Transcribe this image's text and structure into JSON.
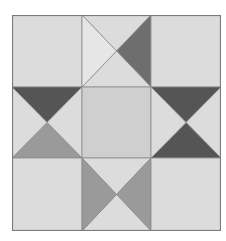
{
  "diagram": {
    "title": "Ohio Star quilt block",
    "grid": {
      "rows": 3,
      "cols": 3
    },
    "colors": {
      "light": "#dcdcdc",
      "lighter": "#e6e6e6",
      "center": "#cfcfcf",
      "medium": "#9a9a9a",
      "mid_dark": "#6e6e6e",
      "dark": "#555555",
      "line": "#8a8a8a"
    },
    "blocks": [
      {
        "name": "top-left",
        "type": "solid",
        "fill": "light"
      },
      {
        "name": "top-middle",
        "type": "hourglass",
        "top": "light",
        "left": "lighter",
        "right": "mid_dark",
        "bottom": "light"
      },
      {
        "name": "top-right",
        "type": "solid",
        "fill": "light"
      },
      {
        "name": "middle-left",
        "type": "hourglass",
        "top": "dark",
        "left": "light",
        "right": "light",
        "bottom": "medium"
      },
      {
        "name": "center",
        "type": "solid",
        "fill": "center"
      },
      {
        "name": "middle-right",
        "type": "hourglass",
        "top": "dark",
        "left": "light",
        "right": "light",
        "bottom": "dark"
      },
      {
        "name": "bottom-left",
        "type": "solid",
        "fill": "light"
      },
      {
        "name": "bottom-middle",
        "type": "hourglass",
        "top": "light",
        "left": "medium",
        "right": "medium",
        "bottom": "light"
      },
      {
        "name": "bottom-right",
        "type": "solid",
        "fill": "light"
      }
    ]
  }
}
